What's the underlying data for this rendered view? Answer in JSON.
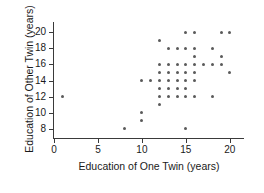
{
  "chart_data": {
    "type": "scatter",
    "title": "",
    "xlabel": "Education of One Twin (years)",
    "ylabel": "Education of Other Twin (years)",
    "xlim": [
      0,
      21.5
    ],
    "ylim": [
      7,
      21
    ],
    "grid": false,
    "legend": "none",
    "xticks": [
      0,
      5,
      10,
      15,
      20
    ],
    "xtick_labels": [
      "0",
      "5",
      "10",
      "15",
      "20"
    ],
    "yticks": [
      8,
      10,
      12,
      14,
      16,
      18,
      20
    ],
    "ytick_labels": [
      "8",
      "10",
      "12",
      "14",
      "16",
      "18",
      "20"
    ],
    "marker": "filled-circle",
    "marker_color": "#5a5a5a",
    "axis_color": "#3a3a3a",
    "points": [
      {
        "x": 1,
        "y": 12
      },
      {
        "x": 8,
        "y": 8
      },
      {
        "x": 10,
        "y": 9
      },
      {
        "x": 10,
        "y": 10
      },
      {
        "x": 10,
        "y": 14
      },
      {
        "x": 11,
        "y": 14
      },
      {
        "x": 12,
        "y": 11
      },
      {
        "x": 12,
        "y": 12
      },
      {
        "x": 12,
        "y": 13
      },
      {
        "x": 12,
        "y": 14
      },
      {
        "x": 12,
        "y": 15
      },
      {
        "x": 12,
        "y": 16
      },
      {
        "x": 12,
        "y": 19
      },
      {
        "x": 13,
        "y": 12
      },
      {
        "x": 13,
        "y": 13
      },
      {
        "x": 13,
        "y": 14
      },
      {
        "x": 13,
        "y": 15
      },
      {
        "x": 13,
        "y": 16
      },
      {
        "x": 13,
        "y": 18
      },
      {
        "x": 14,
        "y": 12
      },
      {
        "x": 14,
        "y": 13
      },
      {
        "x": 14,
        "y": 14
      },
      {
        "x": 14,
        "y": 15
      },
      {
        "x": 14,
        "y": 16
      },
      {
        "x": 14,
        "y": 18
      },
      {
        "x": 15,
        "y": 8
      },
      {
        "x": 15,
        "y": 12
      },
      {
        "x": 15,
        "y": 13
      },
      {
        "x": 15,
        "y": 14
      },
      {
        "x": 15,
        "y": 15
      },
      {
        "x": 15,
        "y": 16
      },
      {
        "x": 15,
        "y": 18
      },
      {
        "x": 15,
        "y": 20
      },
      {
        "x": 16,
        "y": 12
      },
      {
        "x": 16,
        "y": 14
      },
      {
        "x": 16,
        "y": 15
      },
      {
        "x": 16,
        "y": 16
      },
      {
        "x": 16,
        "y": 17
      },
      {
        "x": 16,
        "y": 18
      },
      {
        "x": 16,
        "y": 20
      },
      {
        "x": 17,
        "y": 16
      },
      {
        "x": 18,
        "y": 12
      },
      {
        "x": 18,
        "y": 16
      },
      {
        "x": 18,
        "y": 18
      },
      {
        "x": 19,
        "y": 16
      },
      {
        "x": 19,
        "y": 17
      },
      {
        "x": 19,
        "y": 20
      },
      {
        "x": 20,
        "y": 15
      },
      {
        "x": 20,
        "y": 20
      }
    ]
  }
}
